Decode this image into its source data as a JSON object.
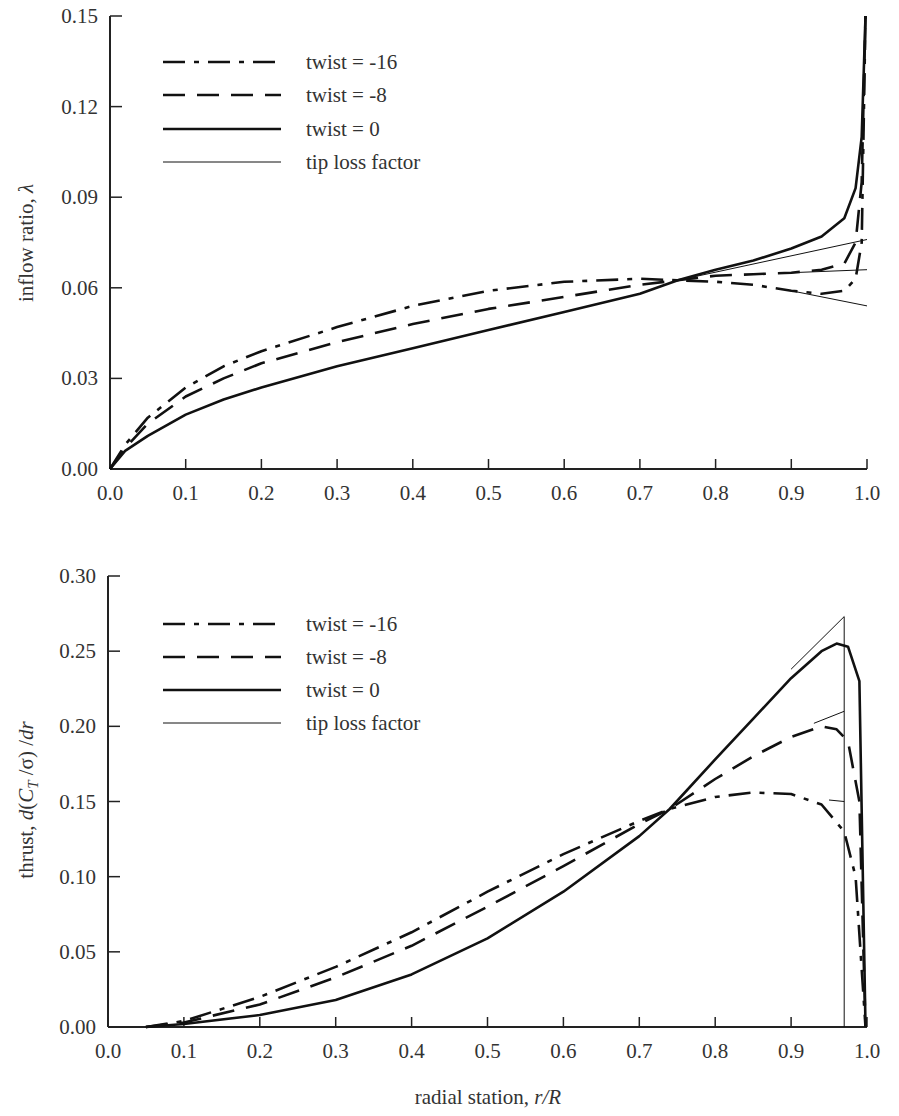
{
  "chart_data": [
    {
      "type": "line",
      "title": "",
      "xlabel": "",
      "ylabel": "inflow ratio, λ",
      "xlim": [
        0.0,
        1.0
      ],
      "ylim": [
        0.0,
        0.15
      ],
      "xticks": [
        "0.0",
        "0.1",
        "0.2",
        "0.3",
        "0.4",
        "0.5",
        "0.6",
        "0.7",
        "0.8",
        "0.9",
        "1.0"
      ],
      "yticks": [
        "0.00",
        "0.03",
        "0.06",
        "0.09",
        "0.12",
        "0.15"
      ],
      "grid": false,
      "legend_position": "upper-left",
      "legend": [
        "twist = -16",
        "twist = -8",
        "twist = 0",
        "tip loss factor"
      ],
      "series": [
        {
          "name": "twist = -16",
          "style": "dash-dot",
          "x": [
            0,
            0.02,
            0.05,
            0.1,
            0.15,
            0.2,
            0.3,
            0.4,
            0.5,
            0.6,
            0.7,
            0.75,
            0.8,
            0.85,
            0.9,
            0.94,
            0.97,
            0.985,
            0.993,
            0.998
          ],
          "y": [
            0,
            0.008,
            0.017,
            0.027,
            0.034,
            0.039,
            0.047,
            0.054,
            0.059,
            0.062,
            0.063,
            0.0625,
            0.062,
            0.061,
            0.059,
            0.058,
            0.059,
            0.063,
            0.075,
            0.15
          ]
        },
        {
          "name": "twist = -8",
          "style": "dashed",
          "x": [
            0,
            0.02,
            0.05,
            0.1,
            0.15,
            0.2,
            0.3,
            0.4,
            0.5,
            0.6,
            0.7,
            0.75,
            0.8,
            0.85,
            0.9,
            0.94,
            0.97,
            0.985,
            0.993,
            0.998
          ],
          "y": [
            0,
            0.007,
            0.015,
            0.024,
            0.03,
            0.035,
            0.042,
            0.048,
            0.053,
            0.057,
            0.061,
            0.0625,
            0.064,
            0.0645,
            0.065,
            0.066,
            0.068,
            0.075,
            0.095,
            0.15
          ]
        },
        {
          "name": "twist = 0",
          "style": "solid",
          "x": [
            0,
            0.02,
            0.05,
            0.1,
            0.15,
            0.2,
            0.3,
            0.4,
            0.5,
            0.6,
            0.7,
            0.75,
            0.8,
            0.85,
            0.9,
            0.94,
            0.97,
            0.985,
            0.993,
            0.998
          ],
          "y": [
            0,
            0.006,
            0.011,
            0.018,
            0.023,
            0.027,
            0.034,
            0.04,
            0.046,
            0.052,
            0.058,
            0.0625,
            0.066,
            0.069,
            0.073,
            0.077,
            0.083,
            0.093,
            0.11,
            0.15
          ]
        },
        {
          "name": "tip loss factor",
          "style": "thin",
          "segments": [
            {
              "x": [
                0.75,
                1.0
              ],
              "y": [
                0.0625,
                0.076
              ]
            },
            {
              "x": [
                0.9,
                1.0
              ],
              "y": [
                0.065,
                0.066
              ]
            },
            {
              "x": [
                0.9,
                1.0
              ],
              "y": [
                0.059,
                0.054
              ]
            }
          ]
        }
      ]
    },
    {
      "type": "line",
      "title": "",
      "xlabel": "radial station, r/R",
      "ylabel": "thrust, d(C_T/σ)/dr",
      "xlim": [
        0.0,
        1.0
      ],
      "ylim": [
        0.0,
        0.3
      ],
      "xticks": [
        "0.0",
        "0.1",
        "0.2",
        "0.3",
        "0.4",
        "0.5",
        "0.6",
        "0.7",
        "0.8",
        "0.9",
        "1.0"
      ],
      "yticks": [
        "0.00",
        "0.05",
        "0.10",
        "0.15",
        "0.20",
        "0.25",
        "0.30"
      ],
      "grid": false,
      "legend_position": "upper-left",
      "legend": [
        "twist = -16",
        "twist = -8",
        "twist = 0",
        "tip loss factor"
      ],
      "series": [
        {
          "name": "twist = -16",
          "style": "dash-dot",
          "x": [
            0.05,
            0.1,
            0.2,
            0.3,
            0.4,
            0.5,
            0.6,
            0.7,
            0.74,
            0.8,
            0.85,
            0.9,
            0.94,
            0.97,
            0.985,
            0.998
          ],
          "y": [
            0,
            0.004,
            0.02,
            0.04,
            0.063,
            0.09,
            0.115,
            0.137,
            0.145,
            0.153,
            0.156,
            0.155,
            0.148,
            0.13,
            0.1,
            0.0
          ]
        },
        {
          "name": "twist = -8",
          "style": "dashed",
          "x": [
            0.05,
            0.1,
            0.2,
            0.3,
            0.4,
            0.5,
            0.6,
            0.7,
            0.74,
            0.8,
            0.85,
            0.9,
            0.94,
            0.96,
            0.975,
            0.99,
            0.998
          ],
          "y": [
            0,
            0.003,
            0.015,
            0.033,
            0.054,
            0.08,
            0.107,
            0.135,
            0.145,
            0.165,
            0.18,
            0.193,
            0.2,
            0.198,
            0.19,
            0.15,
            0.0
          ]
        },
        {
          "name": "twist = 0",
          "style": "solid",
          "x": [
            0.05,
            0.1,
            0.2,
            0.3,
            0.4,
            0.5,
            0.6,
            0.7,
            0.74,
            0.8,
            0.85,
            0.9,
            0.94,
            0.96,
            0.975,
            0.99,
            0.998
          ],
          "y": [
            0,
            0.002,
            0.008,
            0.018,
            0.035,
            0.059,
            0.09,
            0.127,
            0.145,
            0.178,
            0.205,
            0.232,
            0.25,
            0.255,
            0.253,
            0.23,
            0.0
          ]
        },
        {
          "name": "tip loss factor",
          "style": "thin",
          "segments": [
            {
              "x": [
                0.9,
                0.97
              ],
              "y": [
                0.238,
                0.273
              ]
            },
            {
              "x": [
                0.97,
                0.97
              ],
              "y": [
                0.273,
                0.0
              ]
            },
            {
              "x": [
                0.93,
                0.97
              ],
              "y": [
                0.202,
                0.21
              ]
            },
            {
              "x": [
                0.95,
                0.97
              ],
              "y": [
                0.151,
                0.15
              ]
            }
          ]
        }
      ]
    }
  ],
  "labels": {
    "top_ylabel_text": "inflow ratio, ",
    "top_ylabel_symbol": "λ",
    "bottom_ylabel_text": "thrust, ",
    "bottom_xlabel_text": "radial station, ",
    "bottom_xlabel_symbol": "r/R"
  }
}
